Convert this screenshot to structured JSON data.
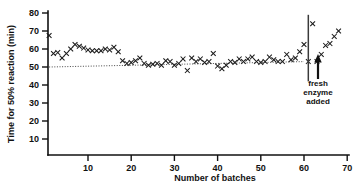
{
  "chart_data": {
    "type": "scatter",
    "title": "",
    "xlabel": "Number of batches",
    "ylabel": "Time for 50% reaction (min)",
    "xlim": [
      0,
      70
    ],
    "ylim": [
      0,
      80
    ],
    "xticks": [
      10,
      20,
      30,
      40,
      50,
      60,
      70
    ],
    "yticks": [
      10,
      20,
      30,
      40,
      50,
      60,
      70,
      80
    ],
    "grid": false,
    "legend": null,
    "marker": "x",
    "x": [
      1,
      2,
      3,
      4,
      5,
      6,
      7,
      8,
      9,
      10,
      11,
      12,
      13,
      14,
      15,
      16,
      17,
      18,
      19,
      20,
      21,
      22,
      23,
      24,
      25,
      26,
      27,
      28,
      29,
      30,
      31,
      32,
      33,
      34,
      35,
      36,
      37,
      38,
      39,
      40,
      41,
      42,
      43,
      44,
      45,
      46,
      47,
      48,
      49,
      50,
      51,
      52,
      53,
      54,
      55,
      56,
      57,
      58,
      59,
      60,
      61,
      62,
      63,
      64,
      65,
      66,
      67,
      68
    ],
    "y": [
      67.5,
      57.5,
      58.0,
      55.0,
      57.5,
      60.0,
      62.5,
      61.5,
      60.5,
      59.5,
      59.0,
      59.0,
      59.0,
      60.0,
      59.5,
      61.0,
      58.5,
      53.5,
      52.0,
      52.5,
      53.5,
      55.0,
      52.0,
      51.0,
      51.5,
      52.0,
      51.0,
      53.5,
      53.0,
      51.0,
      52.0,
      54.5,
      48.0,
      55.0,
      53.0,
      54.5,
      52.5,
      53.0,
      57.5,
      50.5,
      49.0,
      51.0,
      53.0,
      52.5,
      54.5,
      53.0,
      54.5,
      55.5,
      53.0,
      52.5,
      53.0,
      55.5,
      54.0,
      53.0,
      53.0,
      57.0,
      54.0,
      55.0,
      58.5,
      62.5,
      53.0,
      74.0,
      53.0,
      57.0,
      62.0,
      63.0,
      67.0,
      70.0
    ],
    "fit_line": {
      "label": "trend",
      "x": [
        1,
        60
      ],
      "y": [
        50.0,
        53.0
      ],
      "style": "dotted"
    },
    "annotations": [
      {
        "name": "fresh-enzyme-added",
        "text_lines": [
          "fresh",
          "enzyme",
          "added"
        ],
        "x": 65.0,
        "points_to_x": 64.0,
        "points_to_y": 57.5
      },
      {
        "name": "event-divider",
        "type": "vline",
        "x": 61.0,
        "y_from": 79.0,
        "y_to": 42.0
      }
    ]
  },
  "chart_layout": {
    "plot_left_px": 48,
    "plot_bottom_px": 155,
    "plot_right_px": 348,
    "y80_px": 13,
    "y_step_px": 18,
    "x10_px": 88,
    "x_step_px": 43.2
  },
  "labels": {
    "y_axis_title": "Time for 50% reaction (min)",
    "x_axis_title": "Number of batches",
    "y_tick_texts": [
      "80",
      "70",
      "60",
      "50",
      "40",
      "30",
      "20",
      "10"
    ],
    "x_tick_texts": [
      "10",
      "20",
      "30",
      "40",
      "50",
      "60",
      "70"
    ],
    "annotation_line1": "fresh",
    "annotation_line2": "enzyme",
    "annotation_line3": "added"
  },
  "colors": {
    "ink": "#111111",
    "marker": "#1a1a1a",
    "fit": "#333333",
    "background": "#ffffff"
  }
}
